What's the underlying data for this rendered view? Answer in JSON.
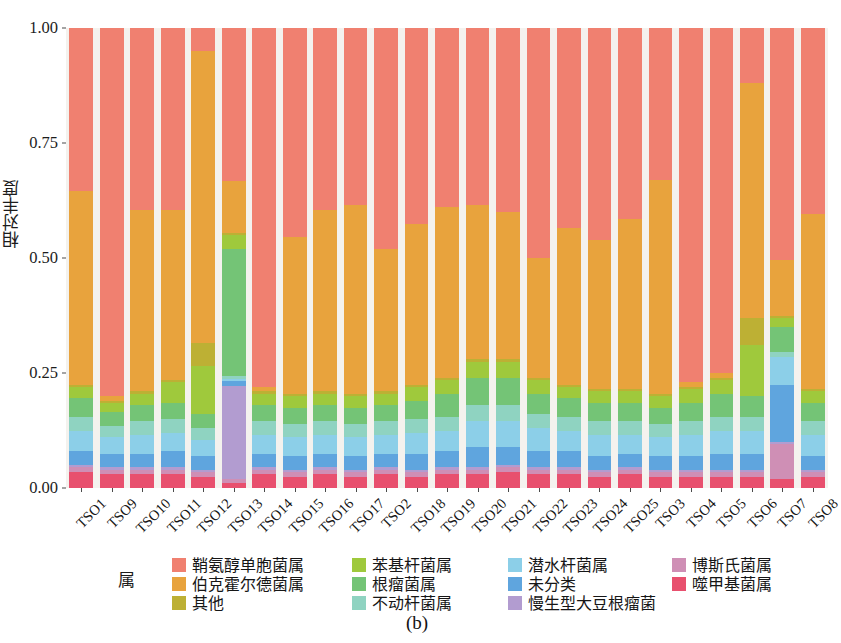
{
  "caption": "(b)",
  "axes": {
    "y_title": "相对丰度",
    "y_ticks": [
      "0.00",
      "0.25",
      "0.50",
      "0.75",
      "1.00"
    ],
    "y_tick_values": [
      0.0,
      0.25,
      0.5,
      0.75,
      1.0
    ],
    "panel_background": "#f4f2ee"
  },
  "legend": {
    "title": "属",
    "columns": [
      [
        {
          "label": "鞘氨醇单胞菌属",
          "color": "#f08070"
        },
        {
          "label": "伯克霍尔德菌属",
          "color": "#e8a33d"
        },
        {
          "label": "其他",
          "color": "#bdb034"
        }
      ],
      [
        {
          "label": "苯基杆菌属",
          "color": "#9fc93c"
        },
        {
          "label": "根瘤菌属",
          "color": "#74c476"
        },
        {
          "label": "不动杆菌属",
          "color": "#8fd3c1"
        }
      ],
      [
        {
          "label": "潜水杆菌属",
          "color": "#8ccfe8"
        },
        {
          "label": "未分类",
          "color": "#5fa5de"
        },
        {
          "label": "慢生型大豆根瘤菌",
          "color": "#b29cd0"
        }
      ],
      [
        {
          "label": "博斯氏菌属",
          "color": "#cf8fb5"
        },
        {
          "label": "噬甲基菌属",
          "color": "#e8506e"
        }
      ]
    ]
  },
  "chart_data": {
    "type": "bar",
    "subtype": "stacked-100-percent",
    "title": "",
    "xlabel": "",
    "ylabel": "相对丰度",
    "ylim": [
      0,
      1
    ],
    "grid": false,
    "legend_position": "bottom",
    "legend_title": "属",
    "categories": [
      "TSO1",
      "TSO9",
      "TSO10",
      "TSO11",
      "TSO12",
      "TSO13",
      "TSO14",
      "TSO15",
      "TSO16",
      "TSO17",
      "TSO2",
      "TSO18",
      "TSO19",
      "TSO20",
      "TSO21",
      "TSO22",
      "TSO23",
      "TSO24",
      "TSO25",
      "TSO3",
      "TSO4",
      "TSO5",
      "TSO6",
      "TSO7",
      "TSO8"
    ],
    "stack_order_bottom_to_top": [
      "噬甲基菌属",
      "博斯氏菌属",
      "慢生型大豆根瘤菌",
      "未分类",
      "潜水杆菌属",
      "不动杆菌属",
      "根瘤菌属",
      "苯基杆菌属",
      "其他",
      "伯克霍尔德菌属",
      "鞘氨醇单胞菌属"
    ],
    "series": [
      {
        "name": "噬甲基菌属",
        "color": "#e8506e",
        "values": [
          0.035,
          0.03,
          0.03,
          0.03,
          0.025,
          0.01,
          0.03,
          0.025,
          0.03,
          0.025,
          0.03,
          0.025,
          0.03,
          0.03,
          0.035,
          0.03,
          0.03,
          0.025,
          0.03,
          0.025,
          0.025,
          0.025,
          0.025,
          0.02,
          0.025
        ]
      },
      {
        "name": "博斯氏菌属",
        "color": "#cf8fb5",
        "values": [
          0.01,
          0.01,
          0.01,
          0.01,
          0.01,
          0.01,
          0.01,
          0.01,
          0.01,
          0.01,
          0.01,
          0.01,
          0.01,
          0.01,
          0.01,
          0.01,
          0.01,
          0.01,
          0.01,
          0.01,
          0.01,
          0.01,
          0.01,
          0.075,
          0.01
        ]
      },
      {
        "name": "慢生型大豆根瘤菌",
        "color": "#b29cd0",
        "values": [
          0.005,
          0.005,
          0.005,
          0.005,
          0.005,
          0.205,
          0.005,
          0.005,
          0.005,
          0.005,
          0.005,
          0.005,
          0.005,
          0.005,
          0.005,
          0.005,
          0.005,
          0.005,
          0.005,
          0.005,
          0.005,
          0.005,
          0.005,
          0.005,
          0.005
        ]
      },
      {
        "name": "未分类",
        "color": "#5fa5de",
        "values": [
          0.03,
          0.03,
          0.03,
          0.035,
          0.03,
          0.01,
          0.03,
          0.03,
          0.03,
          0.03,
          0.03,
          0.035,
          0.035,
          0.045,
          0.04,
          0.035,
          0.035,
          0.03,
          0.03,
          0.03,
          0.03,
          0.035,
          0.035,
          0.125,
          0.03
        ]
      },
      {
        "name": "潜水杆菌属",
        "color": "#8ccfe8",
        "values": [
          0.045,
          0.035,
          0.04,
          0.04,
          0.035,
          0.005,
          0.04,
          0.04,
          0.04,
          0.04,
          0.04,
          0.045,
          0.045,
          0.055,
          0.055,
          0.05,
          0.045,
          0.045,
          0.04,
          0.04,
          0.045,
          0.05,
          0.05,
          0.06,
          0.045
        ]
      },
      {
        "name": "不动杆菌属",
        "color": "#8fd3c1",
        "values": [
          0.03,
          0.025,
          0.03,
          0.03,
          0.025,
          0.005,
          0.03,
          0.03,
          0.03,
          0.03,
          0.03,
          0.03,
          0.03,
          0.035,
          0.035,
          0.03,
          0.03,
          0.03,
          0.03,
          0.03,
          0.03,
          0.03,
          0.03,
          0.01,
          0.03
        ]
      },
      {
        "name": "根瘤菌属",
        "color": "#74c476",
        "values": [
          0.04,
          0.03,
          0.035,
          0.035,
          0.03,
          0.28,
          0.035,
          0.035,
          0.035,
          0.035,
          0.035,
          0.04,
          0.05,
          0.06,
          0.06,
          0.045,
          0.04,
          0.04,
          0.04,
          0.035,
          0.04,
          0.05,
          0.045,
          0.055,
          0.04
        ]
      },
      {
        "name": "苯基杆菌属",
        "color": "#9fc93c",
        "values": [
          0.025,
          0.02,
          0.025,
          0.045,
          0.105,
          0.03,
          0.025,
          0.025,
          0.025,
          0.025,
          0.025,
          0.03,
          0.03,
          0.035,
          0.035,
          0.03,
          0.025,
          0.025,
          0.025,
          0.025,
          0.03,
          0.03,
          0.11,
          0.02,
          0.025
        ]
      },
      {
        "name": "其他",
        "color": "#bdb034",
        "values": [
          0.005,
          0.005,
          0.005,
          0.005,
          0.05,
          0.005,
          0.005,
          0.005,
          0.005,
          0.005,
          0.005,
          0.005,
          0.005,
          0.005,
          0.005,
          0.005,
          0.005,
          0.005,
          0.005,
          0.005,
          0.005,
          0.005,
          0.06,
          0.005,
          0.005
        ]
      },
      {
        "name": "伯克霍尔德菌属",
        "color": "#e8a33d",
        "values": [
          0.42,
          0.01,
          0.395,
          0.37,
          0.635,
          0.115,
          0.01,
          0.34,
          0.395,
          0.41,
          0.31,
          0.35,
          0.37,
          0.335,
          0.32,
          0.26,
          0.34,
          0.325,
          0.37,
          0.465,
          0.01,
          0.01,
          0.51,
          0.12,
          0.38
        ]
      },
      {
        "name": "鞘氨醇单胞菌属",
        "color": "#f08070",
        "values": [
          0.355,
          0.8,
          0.395,
          0.395,
          0.05,
          0.335,
          0.78,
          0.455,
          0.395,
          0.385,
          0.48,
          0.425,
          0.39,
          0.385,
          0.4,
          0.5,
          0.435,
          0.46,
          0.415,
          0.33,
          0.77,
          0.75,
          0.12,
          0.505,
          0.405
        ]
      }
    ]
  }
}
